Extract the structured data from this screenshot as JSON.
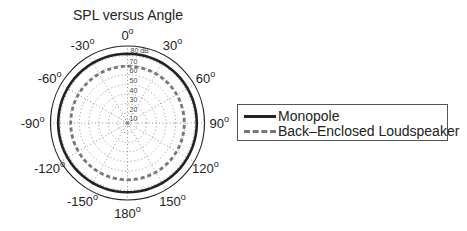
{
  "chart_data": {
    "type": "polar",
    "title": "SPL versus Angle",
    "radial_unit": "dB",
    "radial_max_label": "80 dB",
    "radial_range": [
      0,
      80
    ],
    "radial_ticks": [
      10,
      20,
      30,
      40,
      50,
      60,
      70
    ],
    "angle_ticks": [
      "0",
      "30",
      "60",
      "90",
      "120",
      "150",
      "180",
      "-150",
      "-120",
      "-90",
      "-60",
      "-30"
    ],
    "angle_tick_values": [
      0,
      30,
      60,
      90,
      120,
      150,
      180,
      -150,
      -120,
      -90,
      -60,
      -30
    ],
    "degree_symbol": "o",
    "grid": true,
    "legend_position": "right",
    "series": [
      {
        "name": "Monopole",
        "style": "solid",
        "color": "#222222",
        "angles": [
          0,
          30,
          60,
          90,
          120,
          150,
          180,
          -150,
          -120,
          -90,
          -60,
          -30
        ],
        "values": [
          72,
          72,
          72,
          72,
          72,
          72,
          72,
          72,
          72,
          72,
          72,
          72
        ]
      },
      {
        "name": "Back-Enclosed Loudspeaker",
        "style": "dashed",
        "color": "#777777",
        "angles": [
          0,
          30,
          60,
          90,
          120,
          150,
          180,
          -150,
          -120,
          -90,
          -60,
          -30
        ],
        "values": [
          59,
          59,
          59,
          59,
          59,
          59,
          59,
          59,
          59,
          59,
          59,
          59
        ]
      }
    ]
  },
  "legend": {
    "items": [
      {
        "label": "Monopole"
      },
      {
        "label": "Back–Enclosed Loudspeaker"
      }
    ]
  }
}
